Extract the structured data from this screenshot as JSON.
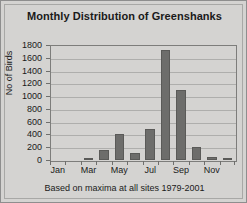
{
  "chart_data": {
    "type": "bar",
    "title": "Monthly Distribution of Greenshanks",
    "subtitle": "Based on maxima at all sites 1979-2001",
    "xlabel": "",
    "ylabel": "No of Birds",
    "ylim": [
      0,
      1800
    ],
    "ytick_labels": [
      "1800",
      "1600",
      "1400",
      "1200",
      "1000",
      "800",
      "600",
      "400",
      "200",
      "0"
    ],
    "ytick_values": [
      1800,
      1600,
      1400,
      1200,
      1000,
      800,
      600,
      400,
      200,
      0
    ],
    "grid": true,
    "legend": "none",
    "categories": [
      "Jan",
      "Feb",
      "Mar",
      "Apr",
      "May",
      "Jun",
      "Jul",
      "Aug",
      "Sep",
      "Oct",
      "Nov",
      "Dec"
    ],
    "xtick_labels_shown": [
      "Jan",
      "",
      "Mar",
      "",
      "May",
      "",
      "Jul",
      "",
      "Sep",
      "",
      "Nov",
      ""
    ],
    "values": [
      0,
      0,
      20,
      150,
      400,
      115,
      480,
      1720,
      1090,
      210,
      50,
      20
    ],
    "bar_color": "#6d6d6b",
    "plot_background": "#d4d3d1",
    "gridline_color": "#aeaeac"
  },
  "figure": {
    "background": "#d4d3d1",
    "frame_color": "#8e8e8e"
  }
}
